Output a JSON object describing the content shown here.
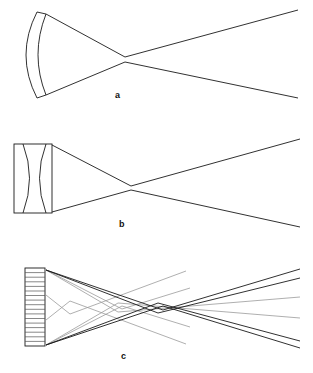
{
  "figure": {
    "title": "",
    "width": 313,
    "height": 373,
    "background": "#ffffff",
    "type": "optical-ray-diagram"
  },
  "colors": {
    "background": "#ffffff",
    "line_dark": "#1a1a1a",
    "line_mid": "#444444",
    "line_light": "#9a9a9a",
    "segment": "#555555",
    "label": "#111111"
  },
  "panels": [
    {
      "id": "a",
      "label": "a",
      "label_x": 115,
      "label_y": 91,
      "element": "curved-concave-mirror",
      "element_description": "Single curved mirror shell with finite thickness, drawn as two concentric arcs closed at top and bottom",
      "mirror": {
        "outer_arc": {
          "x_top": 37,
          "y_top": 12,
          "x_bottom": 37,
          "y_bottom": 98,
          "bulge": -22
        },
        "inner_arc": {
          "x_top": 46,
          "y_top": 14,
          "x_bottom": 46,
          "y_bottom": 95,
          "bulge": -16
        },
        "aperture_top_y": 13,
        "aperture_bottom_y": 97
      },
      "rays": [
        {
          "name": "upper-ray",
          "points": [
            [
              46,
              14
            ],
            [
              125,
              57
            ],
            [
              298,
              10
            ]
          ],
          "shade": "dark"
        },
        {
          "name": "lower-ray",
          "points": [
            [
              46,
              95
            ],
            [
              125,
              62
            ],
            [
              298,
              98
            ]
          ],
          "shade": "dark"
        }
      ],
      "waist": {
        "x": 125,
        "y_top": 57,
        "y_bottom": 62
      }
    },
    {
      "id": "b",
      "label": "b",
      "label_x": 119,
      "label_y": 220,
      "element": "biconcave-lens-in-housing",
      "element_description": "Rectangular housing enclosing a biconcave (hourglass) lens formed by two opposing arcs",
      "housing": {
        "x": 14,
        "y": 144,
        "width": 38,
        "height": 69
      },
      "lens": {
        "left_arc": {
          "x_top": 23,
          "y_top": 144,
          "x_bottom": 23,
          "y_bottom": 213,
          "bulge": 13
        },
        "right_arc": {
          "x_top": 46,
          "y_top": 144,
          "x_bottom": 46,
          "y_bottom": 213,
          "bulge": -13
        }
      },
      "rays": [
        {
          "name": "upper-ray",
          "points": [
            [
              52,
              145
            ],
            [
              131,
              186
            ],
            [
              300,
              139
            ]
          ],
          "shade": "dark"
        },
        {
          "name": "lower-ray",
          "points": [
            [
              52,
              212
            ],
            [
              131,
              190
            ],
            [
              300,
              227
            ]
          ],
          "shade": "dark"
        }
      ],
      "waist": {
        "x": 131,
        "y_top": 186,
        "y_bottom": 190
      }
    },
    {
      "id": "c",
      "label": "c",
      "label_x": 121,
      "label_y": 352,
      "element": "segmented-mirror-array",
      "element_description": "Tall segmented collector made of many stacked horizontal facets, emitting multiple crossing ray bundles",
      "array": {
        "x": 25,
        "y": 268,
        "width": 20,
        "height": 78,
        "segment_count": 17
      },
      "rays": [
        {
          "name": "ray-1-dark",
          "points": [
            [
              46,
              270
            ],
            [
              163,
              310
            ],
            [
              300,
              269
            ]
          ],
          "shade": "dark"
        },
        {
          "name": "ray-2-dark",
          "points": [
            [
              46,
              270
            ],
            [
              158,
              313
            ],
            [
              300,
              278
            ]
          ],
          "shade": "dark"
        },
        {
          "name": "ray-3-dark",
          "points": [
            [
              46,
              345
            ],
            [
              163,
              306
            ],
            [
              300,
              348
            ]
          ],
          "shade": "dark"
        },
        {
          "name": "ray-4-dark",
          "points": [
            [
              46,
              345
            ],
            [
              158,
              303
            ],
            [
              300,
              341
            ]
          ],
          "shade": "dark"
        },
        {
          "name": "ray-5-light",
          "points": [
            [
              46,
              270
            ],
            [
              122,
              309
            ],
            [
              190,
              288
            ]
          ],
          "shade": "light"
        },
        {
          "name": "ray-6-light",
          "points": [
            [
              46,
              270
            ],
            [
              118,
              312
            ],
            [
              300,
              297
            ]
          ],
          "shade": "light"
        },
        {
          "name": "ray-7-light",
          "points": [
            [
              46,
              345
            ],
            [
              122,
              306
            ],
            [
              190,
              327
            ]
          ],
          "shade": "light"
        },
        {
          "name": "ray-8-light",
          "points": [
            [
              46,
              345
            ],
            [
              118,
              303
            ],
            [
              300,
              318
            ]
          ],
          "shade": "light"
        },
        {
          "name": "ray-9-light",
          "points": [
            [
              46,
              295
            ],
            [
              70,
              314
            ],
            [
              186,
              271
            ]
          ],
          "shade": "light"
        },
        {
          "name": "ray-10-light",
          "points": [
            [
              46,
              320
            ],
            [
              70,
              301
            ],
            [
              186,
              344
            ]
          ],
          "shade": "light"
        }
      ]
    }
  ]
}
